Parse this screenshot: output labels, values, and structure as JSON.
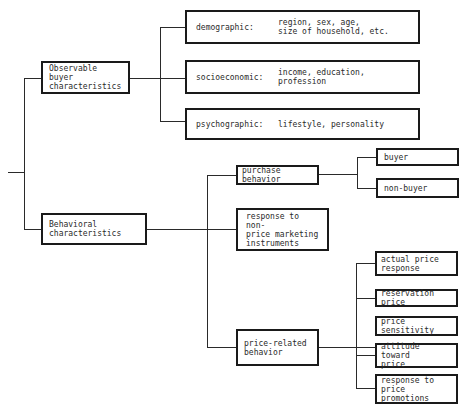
{
  "diagram": {
    "type": "tree",
    "root": {
      "children": [
        {
          "id": "observable",
          "label": "Observable buyer\ncharacteristics",
          "children": [
            {
              "id": "demographic",
              "label": "demographic:",
              "detail": "region, sex, age,\nsize of household, etc."
            },
            {
              "id": "socioeconomic",
              "label": "socioeconomic:",
              "detail": "income, education,\nprofession"
            },
            {
              "id": "psychographic",
              "label": "psychographic:",
              "detail": "lifestyle, personality"
            }
          ]
        },
        {
          "id": "behavioral",
          "label": "Behavioral\ncharacteristics",
          "children": [
            {
              "id": "purchase",
              "label": "purchase behavior",
              "children": [
                {
                  "id": "buyer",
                  "label": "buyer"
                },
                {
                  "id": "non_buyer",
                  "label": "non-buyer"
                }
              ]
            },
            {
              "id": "nonprice",
              "label": "response to non-\nprice marketing\ninstruments"
            },
            {
              "id": "price_related",
              "label": "price-related\nbehavior",
              "children": [
                {
                  "id": "actual_price",
                  "label": "actual price\nresponse"
                },
                {
                  "id": "reservation",
                  "label": "reservation price"
                },
                {
                  "id": "sensitivity",
                  "label": "price sensitivity"
                },
                {
                  "id": "attitude",
                  "label": "attitude toward\nprice"
                },
                {
                  "id": "promotions",
                  "label": "response to price\npromotions"
                }
              ]
            }
          ]
        }
      ]
    }
  },
  "colors": {
    "line": "#2a2a2a",
    "box_border": "#1a1a1a",
    "text": "#2a2a2a",
    "background": "#ffffff"
  }
}
